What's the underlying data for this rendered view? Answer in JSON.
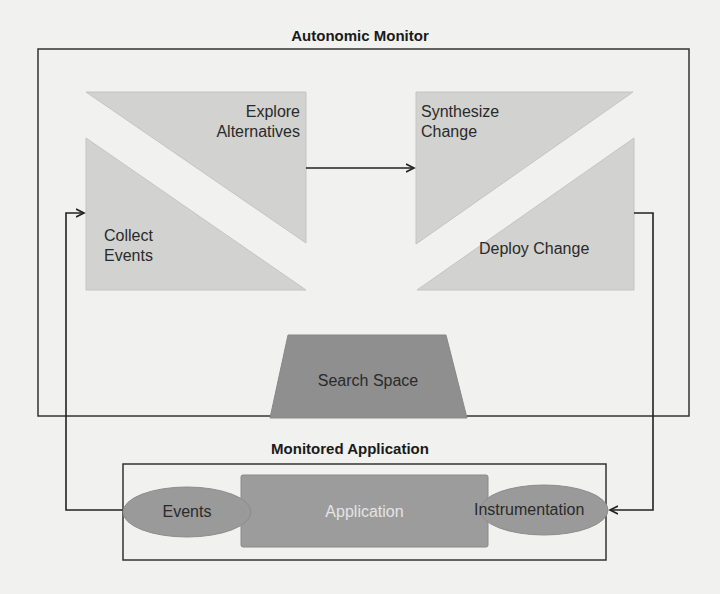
{
  "diagram": {
    "outer_box": {
      "title": "Autonomic Monitor"
    },
    "inner_box": {
      "title": "Monitored Application"
    },
    "nodes": {
      "explore": {
        "line1": "Explore",
        "line2": "Alternatives"
      },
      "synthesize": {
        "line1": "Synthesize",
        "line2": "Change"
      },
      "collect": {
        "line1": "Collect",
        "line2": "Events"
      },
      "deploy": {
        "label": "Deploy Change"
      },
      "search_space": {
        "label": "Search Space"
      },
      "application": {
        "label": "Application"
      },
      "events": {
        "label": "Events"
      },
      "instrumentation": {
        "label": "Instrumentation"
      }
    },
    "edges": [
      {
        "from": "Explore Alternatives",
        "to": "Synthesize Change"
      },
      {
        "from": "Deploy Change",
        "to": "Instrumentation"
      },
      {
        "from": "Events",
        "to": "Collect Events"
      }
    ],
    "colors": {
      "background": "#f1f1ef",
      "light_shape": "#d2d2d0",
      "dark_shape": "#8f8f8f",
      "app_box": "#9c9c9c",
      "ellipse": "#9a9a9a",
      "line": "#222222"
    }
  }
}
